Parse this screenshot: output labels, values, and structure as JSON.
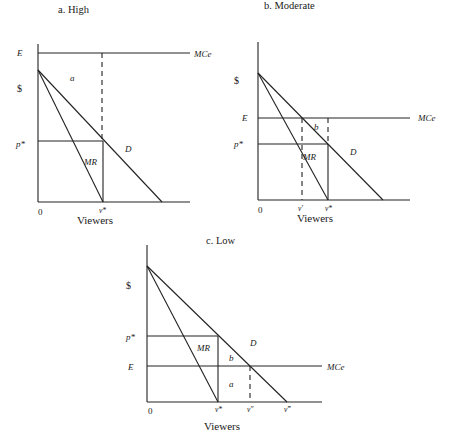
{
  "figure": {
    "panels": [
      {
        "id": "a",
        "title": "a. High",
        "y_axis_symbol": "$",
        "x_axis_label": "Viewers",
        "origin_label": "0",
        "labels": {
          "E": "E",
          "MCe": "MCe",
          "p_star": "p*",
          "MR": "MR",
          "D": "D",
          "area_a": "a",
          "v_star": "v*"
        }
      },
      {
        "id": "b",
        "title": "b. Moderate",
        "y_axis_symbol": "$",
        "x_axis_label": "Viewers",
        "origin_label": "0",
        "labels": {
          "E": "E",
          "MCe": "MCe",
          "p_star": "p*",
          "MR": "MR",
          "D": "D",
          "area_b": "b",
          "v_prime": "v′",
          "v_star": "v*"
        }
      },
      {
        "id": "c",
        "title": "c. Low",
        "y_axis_symbol": "$",
        "x_axis_label": "Viewers",
        "origin_label": "0",
        "labels": {
          "E": "E",
          "MCe": "MCe",
          "p_star": "p*",
          "MR": "MR",
          "D": "D",
          "area_a": "a",
          "area_b": "b",
          "v_star": "v*",
          "v_double_prime": "v″",
          "v_triple_prime": "v‴"
        }
      }
    ]
  }
}
